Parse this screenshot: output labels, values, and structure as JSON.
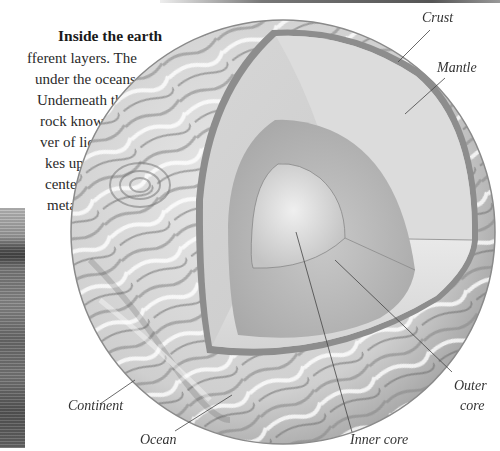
{
  "section": {
    "title": "Inside the earth",
    "body_lines": [
      "fferent layers. The",
      "under the oceans,",
      "Underneath the",
      "rock known",
      "ver of liquid",
      "kes up the",
      "center is",
      "metals."
    ]
  },
  "diagram": {
    "labels": {
      "crust": "Crust",
      "mantle": "Mantle",
      "outer_core": "Outer",
      "outer_core_2": "core",
      "inner_core": "Inner core",
      "ocean": "Ocean",
      "continent": "Continent"
    }
  }
}
